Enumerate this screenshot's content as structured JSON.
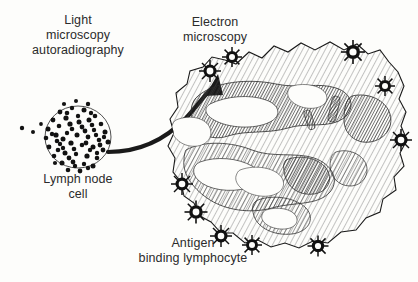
{
  "figure": {
    "background_color": "#fdfdfb",
    "ink_color": "#1a1a1a",
    "text_color": "#2b2b2b",
    "border_color": "#d8d8d4"
  },
  "labels": {
    "light_microscopy": "Light\nmicroscopy\nautoradiography",
    "electron_microscopy": "Electron\nmicroscopy",
    "lymph_node_cell": "Lymph node\ncell",
    "antigen_binding_lymphocyte": "Antigen\nbinding lymphocyte"
  },
  "diagram": {
    "arrow": {
      "name": "transition-arrow",
      "direction": "left-to-right-upward",
      "style": "thick curved solid with triangular head"
    },
    "autoradiograph_cell": {
      "name": "lymph-node-cell",
      "center": [
        78,
        137
      ],
      "radius": 33,
      "grain_count": 96,
      "grain_color": "#111111",
      "description": "circular cell outline densely covered with black silver grains"
    },
    "lymphocyte": {
      "name": "antigen-binding-lymphocyte",
      "center": [
        288,
        146
      ],
      "description": "large irregular rounded cell with fine diagonal hatching, dense chromatin regions and white cytoplasmic gaps",
      "hatch_color": "#3a3a3a",
      "outline_color": "#1a1a1a"
    },
    "receptor_clusters": {
      "name": "antigen-receptor-cluster",
      "count": 10,
      "color": "#111111",
      "description": "spiky dark antigen clusters bound at the cell periphery",
      "positions": [
        [
          210,
          71
        ],
        [
          232,
          57
        ],
        [
          353,
          52
        ],
        [
          385,
          86
        ],
        [
          182,
          184
        ],
        [
          196,
          212
        ],
        [
          221,
          236
        ],
        [
          252,
          245
        ],
        [
          318,
          246
        ],
        [
          401,
          140
        ]
      ]
    }
  }
}
